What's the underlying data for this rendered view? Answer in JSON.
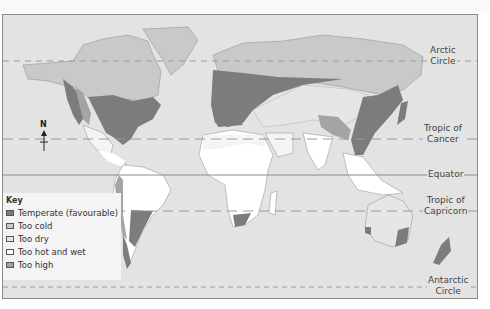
{
  "colors": {
    "sea": "#e3e3e3",
    "land": "#f4f4f4",
    "temperate": "#7c7c7c",
    "too_cold": "#c9c9c9",
    "too_dry": "#e6e6e6",
    "too_hot_and_wet": "#ffffff",
    "too_high": "#a4a4a4",
    "line": "#8a8a8a"
  },
  "compass": {
    "label": "N"
  },
  "latitude_lines": {
    "arctic": {
      "line1": "Arctic",
      "line2": "Circle"
    },
    "cancer": {
      "line1": "Tropic of",
      "line2": "Cancer"
    },
    "equator": {
      "line1": "Equator"
    },
    "capricorn": {
      "line1": "Tropic of",
      "line2": "Capricorn"
    },
    "antarctic": {
      "line1": "Antarctic",
      "line2": "Circle"
    }
  },
  "legend": {
    "title": "Key",
    "items": [
      {
        "label": "Temperate (favourable)",
        "color": "#7c7c7c"
      },
      {
        "label": "Too cold",
        "color": "#c9c9c9"
      },
      {
        "label": "Too dry",
        "color": "#e6e6e6"
      },
      {
        "label": "Too hot and wet",
        "color": "#ffffff"
      },
      {
        "label": "Too high",
        "color": "#a4a4a4"
      }
    ]
  }
}
